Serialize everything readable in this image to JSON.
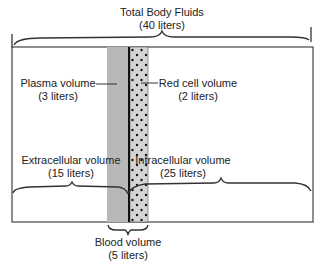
{
  "title": {
    "line1": "Total Body Fluids",
    "line2": "(40 liters)"
  },
  "plasma": {
    "line1": "Plasma volume",
    "line2": "(3 liters)"
  },
  "red_cell": {
    "line1": "Red cell volume",
    "line2": "(2 liters)"
  },
  "extracellular": {
    "line1": "Extracellular volume",
    "line2": "(15 liters)"
  },
  "intracellular": {
    "line1": "Intracellular volume",
    "line2": "(25 liters)"
  },
  "blood": {
    "line1": "Blood volume",
    "line2": "(5 liters)"
  },
  "colors": {
    "plasma_fill": "#b8b8b8",
    "red_cell_fill": "#d6d6d6",
    "line": "#333333",
    "divider": "#111111"
  }
}
